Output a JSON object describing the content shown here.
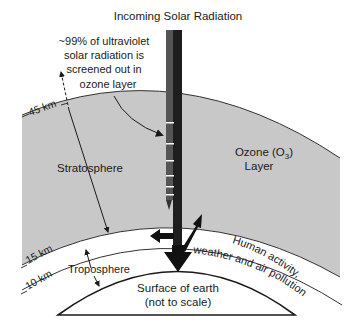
{
  "title": "Incoming Solar Radiation",
  "annotation": {
    "lines": [
      "~99% of ultraviolet",
      "solar radiation is",
      "screened out in",
      "ozone layer"
    ]
  },
  "layers": {
    "stratosphere": "Stratosphere",
    "ozone_line1": "Ozone (O",
    "ozone_sub": "3",
    "ozone_close": ")",
    "ozone_line2": "Layer",
    "troposphere": "Troposphere"
  },
  "altitudes": {
    "top": "45 km",
    "mid": "15 km",
    "low": "10 km"
  },
  "human_activity": {
    "line1": "Human activity,",
    "line2": "weather and air pollution"
  },
  "earth": {
    "line1": "Surface of earth",
    "line2": "(not to scale)"
  },
  "colors": {
    "ozone_fill": "#c8c8c8",
    "background": "#ffffff",
    "ink": "#1a1a1a",
    "beam_dark": "#222222",
    "beam_light": "#555555"
  }
}
